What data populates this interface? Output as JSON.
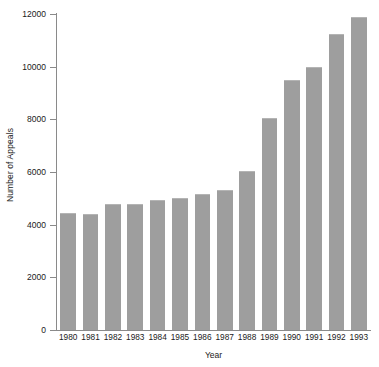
{
  "chart_data": {
    "type": "bar",
    "title": "",
    "xlabel": "Year",
    "ylabel": "Number of Appeals",
    "categories": [
      "1980",
      "1981",
      "1982",
      "1983",
      "1984",
      "1985",
      "1986",
      "1987",
      "1988",
      "1989",
      "1990",
      "1991",
      "1992",
      "1993"
    ],
    "values": [
      4430,
      4400,
      4780,
      4800,
      4930,
      5020,
      5180,
      5320,
      6050,
      8070,
      9500,
      10000,
      11250,
      11900
    ],
    "series": [
      {
        "name": "Number of Appeals",
        "values": [
          4430,
          4400,
          4780,
          4800,
          4930,
          5020,
          5180,
          5320,
          6050,
          8070,
          9500,
          10000,
          11250,
          11900
        ]
      }
    ],
    "ylim": [
      0,
      12000
    ],
    "ytick_values": [
      0,
      2000,
      4000,
      6000,
      8000,
      10000,
      12000
    ],
    "ytick_labels": [
      "0",
      "2000",
      "4000",
      "6000",
      "8000",
      "10000",
      "12000"
    ],
    "grid": false,
    "legend": false,
    "bar_color": "#9e9e9e",
    "axis_color": "#8a8a8a"
  }
}
